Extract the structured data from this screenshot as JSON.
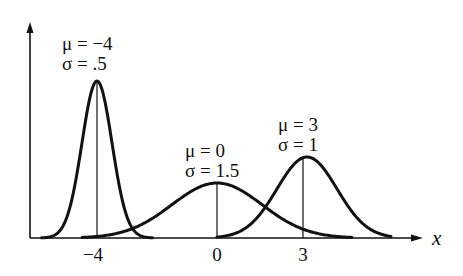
{
  "chart_data": {
    "type": "line",
    "title": "",
    "xlabel": "x",
    "ylabel": "",
    "xticks": [
      -4,
      0,
      3
    ],
    "xtick_labels": [
      "−4",
      "0",
      "3"
    ],
    "grid": false,
    "legend": "none",
    "series": [
      {
        "name": "μ = −4, σ = .5",
        "mu": -4,
        "sigma": 0.5,
        "label_mu": "μ = −4",
        "label_sigma": "σ = .5"
      },
      {
        "name": "μ = 0, σ = 1.5",
        "mu": 0,
        "sigma": 1.5,
        "label_mu": "μ = 0",
        "label_sigma": "σ = 1.5"
      },
      {
        "name": "μ = 3, σ = 1",
        "mu": 3,
        "sigma": 1,
        "label_mu": "μ = 3",
        "label_sigma": "σ = 1"
      }
    ],
    "annotations": [
      "vertical line at each mean from x-axis to curve peak"
    ]
  },
  "axis": {
    "x_name": "x"
  },
  "ticks": {
    "t0": "−4",
    "t1": "0",
    "t2": "3"
  },
  "labels": {
    "a_mu": "μ = −4",
    "a_sigma": "σ = .5",
    "b_mu": "μ = 0",
    "b_sigma": "σ = 1.5",
    "c_mu": "μ = 3",
    "c_sigma": "σ = 1"
  },
  "colors": {
    "ink": "#111111",
    "background": "#ffffff"
  }
}
